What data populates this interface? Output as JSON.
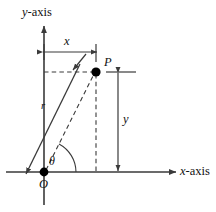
{
  "figure": {
    "kind": "polar-coordinates-diagram",
    "background_color": "#ffffff",
    "line_color": "#3a3a3a",
    "text_color": "#111111",
    "dot_color": "#000000"
  },
  "axes": {
    "y_axis_label": "y-axis",
    "y_axis_label_italic_part": "y",
    "y_axis_label_rest": "-axis",
    "x_axis_label": "x-axis",
    "x_axis_label_italic_part": "x",
    "x_axis_label_rest": "-axis"
  },
  "labels": {
    "origin": "O",
    "point": "P",
    "radius": "r",
    "angle": "θ",
    "horizontal_distance": "x",
    "vertical_distance": "y"
  },
  "geometry": {
    "origin_px": [
      44,
      172
    ],
    "point_p_px": [
      96,
      72
    ],
    "x_dimension_from_px": [
      44,
      52
    ],
    "x_dimension_to_px": [
      96,
      52
    ],
    "y_dimension_from_px": [
      118,
      72
    ],
    "y_dimension_to_px": [
      118,
      172
    ],
    "angle_arc_degrees": 62
  },
  "icons": {
    "arrow_head": "arrowhead-icon",
    "point_marker": "filled-dot-icon"
  }
}
